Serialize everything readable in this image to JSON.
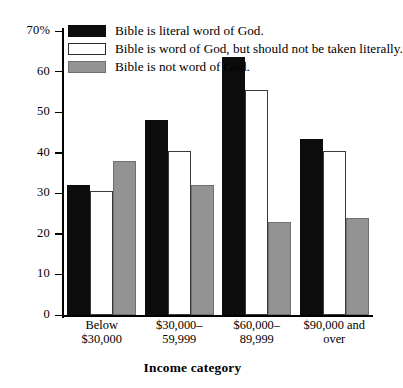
{
  "chart_data": {
    "type": "bar",
    "title": "",
    "xlabel": "Income category",
    "ylabel": "",
    "ylim": [
      0,
      70
    ],
    "ytick_values": [
      0,
      10,
      20,
      30,
      40,
      50,
      60,
      70
    ],
    "ytick_labels": [
      "0",
      "10",
      "20",
      "30",
      "40",
      "50",
      "60",
      "70%"
    ],
    "grid": false,
    "legend_position": "top-left",
    "categories": [
      "Below $30,000",
      "$30,000–59,999",
      "$60,000–89,999",
      "$90,000 and over"
    ],
    "category_lines": [
      [
        "Below",
        "$30,000"
      ],
      [
        "$30,000–",
        "59,999"
      ],
      [
        "$60,000–",
        "89,999"
      ],
      [
        "$90,000 and",
        "over"
      ]
    ],
    "series": [
      {
        "name": "Bible is literal word of God.",
        "color": "#0d0d0d",
        "values": [
          32,
          48,
          63.5,
          43.5
        ]
      },
      {
        "name": "Bible is word of God, but should not be taken literally.",
        "color": "#ffffff",
        "values": [
          30.5,
          40.5,
          55.5,
          40.5
        ]
      },
      {
        "name": "Bible is not word of God.",
        "color": "#939393",
        "values": [
          38,
          32,
          23,
          24
        ]
      }
    ]
  },
  "legend": {
    "items": [
      {
        "label": "Bible is literal word of God.",
        "swatch": "black"
      },
      {
        "label": "Bible is word of God, but should not be taken literally.",
        "swatch": "white"
      },
      {
        "label": "Bible is not word of God.",
        "swatch": "gray"
      }
    ]
  },
  "axis": {
    "x_title": "Income category"
  }
}
